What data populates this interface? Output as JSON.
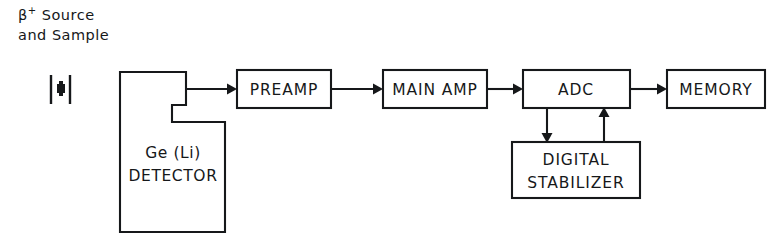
{
  "figure": {
    "type": "block-diagram",
    "background_color": "#ffffff",
    "line_color": "#16181a"
  },
  "caption": {
    "line1_prefix": "β",
    "line1_superscript": "+",
    "line1_rest": " Source",
    "line1_full": "β+ Source",
    "line2": "and Sample"
  },
  "source_symbol": {
    "name": "beta-source-sample",
    "description": "sample holder with source between two vertical bars"
  },
  "blocks": [
    {
      "id": "detector",
      "label_line1": "Ge (Li)",
      "label_line2": "DETECTOR",
      "shape": "notched"
    },
    {
      "id": "preamp",
      "label": "PREAMP",
      "shape": "rect"
    },
    {
      "id": "main_amp",
      "label": "MAIN AMP",
      "shape": "rect"
    },
    {
      "id": "adc",
      "label": "ADC",
      "shape": "rect"
    },
    {
      "id": "memory",
      "label": "MEMORY",
      "shape": "rect"
    },
    {
      "id": "stabilizer",
      "label_line1": "DIGITAL",
      "label_line2": "STABILIZER",
      "shape": "rect"
    }
  ],
  "connections": [
    {
      "from": "detector",
      "to": "preamp",
      "direction": "right"
    },
    {
      "from": "preamp",
      "to": "main_amp",
      "direction": "right"
    },
    {
      "from": "main_amp",
      "to": "adc",
      "direction": "right"
    },
    {
      "from": "adc",
      "to": "memory",
      "direction": "right"
    },
    {
      "from": "adc",
      "to": "stabilizer",
      "direction": "down"
    },
    {
      "from": "stabilizer",
      "to": "adc",
      "direction": "up"
    }
  ]
}
